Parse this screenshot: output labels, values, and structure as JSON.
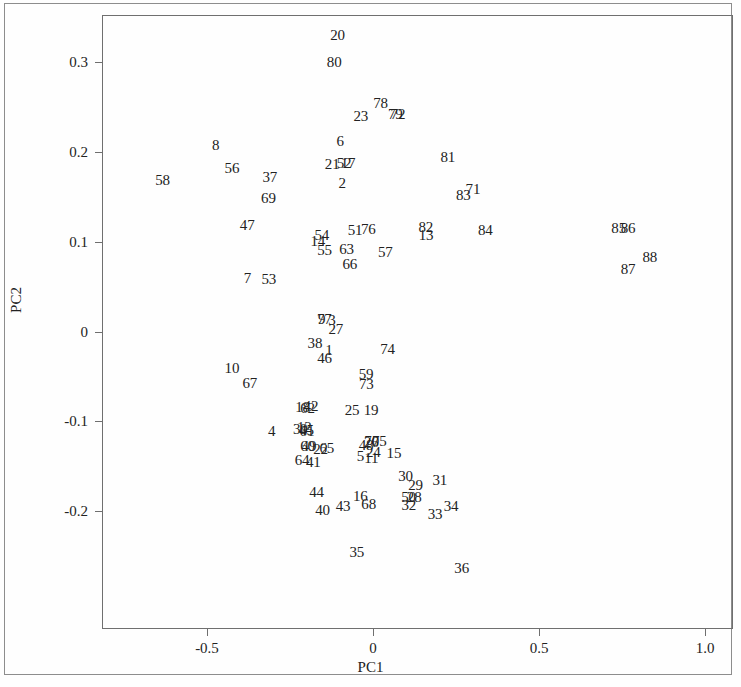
{
  "figure": {
    "background": "#fefefe",
    "frame_color": "#6f6f6f",
    "text_color": "#222222"
  },
  "axes": {
    "x_title": "PC1",
    "y_title": "PC2",
    "x_ticks": [
      "-0.5",
      "0",
      "0.5",
      "1.0"
    ],
    "x_tick_values": [
      -0.5,
      0,
      0.5,
      1.0
    ],
    "y_ticks": [
      "0.3",
      "0.2",
      "0.1",
      "0",
      "-0.1",
      "-0.2"
    ],
    "y_tick_values": [
      0.3,
      0.2,
      0.1,
      0,
      -0.1,
      -0.2
    ],
    "xlim": [
      -0.83,
      1.08
    ],
    "ylim": [
      -0.28,
      0.35
    ]
  },
  "chart_data": {
    "type": "scatter",
    "title": "",
    "xlabel": "PC1",
    "ylabel": "PC2",
    "xlim": [
      -0.83,
      1.08
    ],
    "ylim": [
      -0.28,
      0.35
    ],
    "grid": false,
    "legend": false,
    "point_style": "text-label",
    "labels": [
      "1",
      "2",
      "3",
      "4",
      "5",
      "6",
      "7",
      "8",
      "9",
      "10",
      "11",
      "12",
      "13",
      "14",
      "15",
      "16",
      "17",
      "18",
      "19",
      "20",
      "21",
      "22",
      "23",
      "24",
      "25",
      "26",
      "27",
      "28",
      "29",
      "30",
      "31",
      "32",
      "33",
      "34",
      "35",
      "36",
      "37",
      "38",
      "39",
      "40",
      "41",
      "42",
      "43",
      "44",
      "45",
      "46",
      "47",
      "48",
      "49",
      "50",
      "51",
      "52",
      "53",
      "54",
      "55",
      "56",
      "57",
      "58",
      "59",
      "60",
      "61",
      "62",
      "63",
      "64",
      "65",
      "66",
      "67",
      "68",
      "69",
      "70",
      "71",
      "72",
      "73",
      "74",
      "75",
      "76",
      "77",
      "78",
      "79",
      "80",
      "81",
      "82",
      "83",
      "84",
      "85",
      "86",
      "87",
      "88"
    ],
    "points": [
      {
        "label": "1",
        "x": -0.133,
        "y": -0.021
      },
      {
        "label": "2",
        "x": -0.093,
        "y": 0.166
      },
      {
        "label": "3",
        "x": -0.124,
        "y": 0.013
      },
      {
        "label": "4",
        "x": -0.305,
        "y": -0.111
      },
      {
        "label": "5",
        "x": -0.038,
        "y": -0.139
      },
      {
        "label": "6",
        "x": -0.099,
        "y": 0.212
      },
      {
        "label": "7",
        "x": -0.378,
        "y": 0.06
      },
      {
        "label": "8",
        "x": -0.474,
        "y": 0.208
      },
      {
        "label": "9",
        "x": -0.155,
        "y": 0.014
      },
      {
        "label": "10",
        "x": -0.425,
        "y": -0.041
      },
      {
        "label": "11",
        "x": -0.005,
        "y": -0.141
      },
      {
        "label": "12",
        "x": -0.207,
        "y": -0.107
      },
      {
        "label": "13",
        "x": 0.16,
        "y": 0.108
      },
      {
        "label": "14",
        "x": -0.166,
        "y": 0.101
      },
      {
        "label": "15",
        "x": 0.063,
        "y": -0.136
      },
      {
        "label": "16",
        "x": -0.038,
        "y": -0.183
      },
      {
        "label": "17",
        "x": -0.075,
        "y": 0.188
      },
      {
        "label": "18",
        "x": -0.212,
        "y": -0.084
      },
      {
        "label": "19",
        "x": -0.006,
        "y": -0.087
      },
      {
        "label": "20",
        "x": -0.107,
        "y": 0.331
      },
      {
        "label": "21",
        "x": -0.123,
        "y": 0.187
      },
      {
        "label": "22",
        "x": -0.158,
        "y": -0.131
      },
      {
        "label": "23",
        "x": -0.037,
        "y": 0.24
      },
      {
        "label": "24",
        "x": 0.001,
        "y": -0.134
      },
      {
        "label": "25",
        "x": -0.063,
        "y": -0.087
      },
      {
        "label": "26",
        "x": -0.005,
        "y": -0.123
      },
      {
        "label": "27",
        "x": -0.112,
        "y": 0.003
      },
      {
        "label": "28",
        "x": 0.124,
        "y": -0.184
      },
      {
        "label": "29",
        "x": 0.128,
        "y": -0.171
      },
      {
        "label": "30",
        "x": 0.098,
        "y": -0.161
      },
      {
        "label": "31",
        "x": 0.201,
        "y": -0.166
      },
      {
        "label": "32",
        "x": 0.108,
        "y": -0.193
      },
      {
        "label": "33",
        "x": 0.187,
        "y": -0.203
      },
      {
        "label": "34",
        "x": 0.235,
        "y": -0.195
      },
      {
        "label": "35",
        "x": -0.049,
        "y": -0.246
      },
      {
        "label": "36",
        "x": 0.267,
        "y": -0.264
      },
      {
        "label": "37",
        "x": -0.311,
        "y": 0.172
      },
      {
        "label": "38",
        "x": -0.175,
        "y": -0.013
      },
      {
        "label": "39",
        "x": -0.219,
        "y": -0.109
      },
      {
        "label": "40",
        "x": -0.152,
        "y": -0.199
      },
      {
        "label": "41",
        "x": -0.18,
        "y": -0.146
      },
      {
        "label": "42",
        "x": -0.187,
        "y": -0.083
      },
      {
        "label": "43",
        "x": -0.09,
        "y": -0.194
      },
      {
        "label": "44",
        "x": -0.17,
        "y": -0.179
      },
      {
        "label": "45",
        "x": -0.2,
        "y": -0.11
      },
      {
        "label": "46",
        "x": -0.146,
        "y": -0.029
      },
      {
        "label": "47",
        "x": -0.379,
        "y": 0.119
      },
      {
        "label": "48",
        "x": -0.021,
        "y": -0.126
      },
      {
        "label": "49",
        "x": -0.193,
        "y": -0.128
      },
      {
        "label": "50",
        "x": 0.107,
        "y": -0.184
      },
      {
        "label": "51",
        "x": -0.054,
        "y": 0.113
      },
      {
        "label": "52",
        "x": -0.087,
        "y": 0.188
      },
      {
        "label": "53",
        "x": -0.314,
        "y": 0.058
      },
      {
        "label": "54",
        "x": -0.154,
        "y": 0.108
      },
      {
        "label": "55",
        "x": -0.146,
        "y": 0.091
      },
      {
        "label": "56",
        "x": -0.425,
        "y": 0.182
      },
      {
        "label": "57",
        "x": 0.037,
        "y": 0.089
      },
      {
        "label": "58",
        "x": -0.634,
        "y": 0.169
      },
      {
        "label": "59",
        "x": -0.021,
        "y": -0.047
      },
      {
        "label": "60",
        "x": -0.197,
        "y": -0.128
      },
      {
        "label": "61",
        "x": -0.199,
        "y": -0.111
      },
      {
        "label": "62",
        "x": -0.197,
        "y": -0.085
      },
      {
        "label": "63",
        "x": -0.08,
        "y": 0.092
      },
      {
        "label": "64",
        "x": -0.214,
        "y": -0.143
      },
      {
        "label": "65",
        "x": -0.139,
        "y": -0.13
      },
      {
        "label": "66",
        "x": -0.07,
        "y": 0.075
      },
      {
        "label": "67",
        "x": -0.371,
        "y": -0.057
      },
      {
        "label": "68",
        "x": -0.013,
        "y": -0.192
      },
      {
        "label": "69",
        "x": -0.315,
        "y": 0.149
      },
      {
        "label": "70",
        "x": -0.004,
        "y": -0.122
      },
      {
        "label": "71",
        "x": 0.301,
        "y": 0.159
      },
      {
        "label": "72",
        "x": 0.075,
        "y": 0.243
      },
      {
        "label": "73",
        "x": -0.02,
        "y": -0.059
      },
      {
        "label": "74",
        "x": 0.044,
        "y": -0.02
      },
      {
        "label": "75",
        "x": 0.019,
        "y": -0.122
      },
      {
        "label": "76",
        "x": -0.014,
        "y": 0.114
      },
      {
        "label": "77",
        "x": -0.147,
        "y": 0.014
      },
      {
        "label": "78",
        "x": 0.023,
        "y": 0.255
      },
      {
        "label": "79",
        "x": 0.067,
        "y": 0.243
      },
      {
        "label": "80",
        "x": -0.117,
        "y": 0.3
      },
      {
        "label": "81",
        "x": 0.225,
        "y": 0.194
      },
      {
        "label": "82",
        "x": 0.159,
        "y": 0.117
      },
      {
        "label": "83",
        "x": 0.272,
        "y": 0.152
      },
      {
        "label": "84",
        "x": 0.338,
        "y": 0.113
      },
      {
        "label": "85",
        "x": 0.74,
        "y": 0.115
      },
      {
        "label": "86",
        "x": 0.768,
        "y": 0.115
      },
      {
        "label": "87",
        "x": 0.768,
        "y": 0.07
      },
      {
        "label": "88",
        "x": 0.834,
        "y": 0.083
      }
    ]
  }
}
